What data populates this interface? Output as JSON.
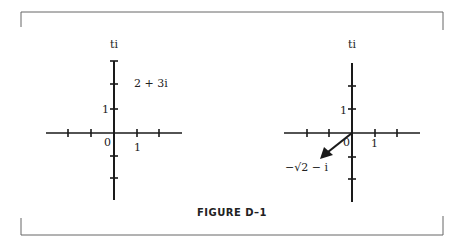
{
  "figure": {
    "caption": "FIGURE D–1",
    "left_plane": {
      "axis_label_imag": "ti",
      "tick_label_y": "1",
      "origin_label": "0",
      "tick_label_x": "1",
      "point_label": "2 +  3i"
    },
    "right_plane": {
      "axis_label_imag": "ti",
      "tick_label_y": "1",
      "origin_label": "0",
      "tick_label_x": "1",
      "vector_label": "−√2 − i"
    }
  },
  "colors": {
    "ink": "#1a1a1a",
    "border": "#555555",
    "background": "#ffffff"
  }
}
